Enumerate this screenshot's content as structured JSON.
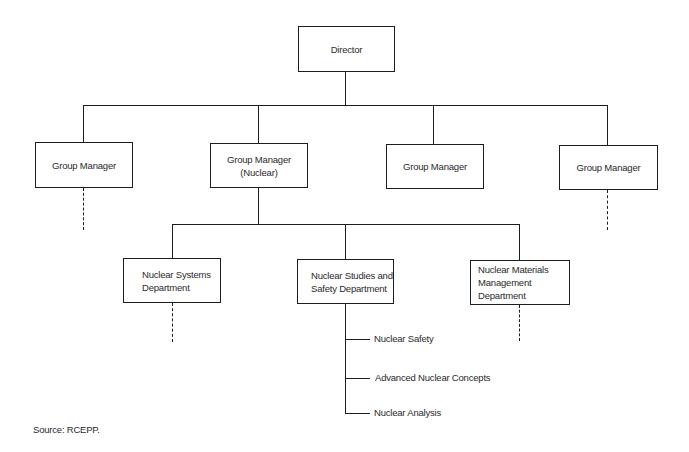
{
  "diagram": {
    "type": "org-chart",
    "root": {
      "label": "Director",
      "children": [
        {
          "label": "Group Manager",
          "has_more_below": true
        },
        {
          "label": "Group Manager (Nuclear)",
          "children": [
            {
              "label": "Nuclear Systems\nDepartment",
              "has_more_below": true
            },
            {
              "label": "Nuclear Studies and\nSafety Department",
              "children": [
                {
                  "label": "Nuclear Safety"
                },
                {
                  "label": "Advanced Nuclear Concepts"
                },
                {
                  "label": "Nuclear Analysis"
                }
              ]
            },
            {
              "label": "Nuclear Materials\nManagement Department",
              "has_more_below": true
            }
          ]
        },
        {
          "label": "Group Manager"
        },
        {
          "label": "Group Manager",
          "has_more_below": true
        }
      ]
    }
  },
  "nodes": {
    "director": "Director",
    "gm1": "Group Manager",
    "gm_nuclear": "Group Manager (Nuclear)",
    "gm3": "Group Manager",
    "gm4": "Group Manager",
    "nsd": "Nuclear Systems\nDepartment",
    "nssd": "Nuclear Studies and\nSafety Department",
    "nmmd": "Nuclear Materials\nManagement Department"
  },
  "leaves": {
    "nuclear_safety": "Nuclear Safety",
    "advanced_concepts": "Advanced Nuclear Concepts",
    "nuclear_analysis": "Nuclear Analysis"
  },
  "source": "Source: RCEPP."
}
